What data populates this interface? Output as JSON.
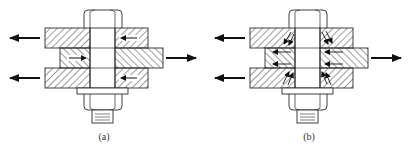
{
  "figure": {
    "colors": {
      "line": "#2a2a2a",
      "hatch": "#3a3a3a",
      "arrow": "#111111",
      "background": "#ffffff"
    },
    "panels": [
      {
        "id": "a",
        "label": "(a)",
        "offset_x": 0,
        "caption_meaning": "Load transferred by bearing/shear: single horizontal arrows inside plates",
        "internal_arrows": "horizontal"
      },
      {
        "id": "b",
        "label": "(b)",
        "offset_x": 205,
        "caption_meaning": "Load transferred by friction with clamping: diagonal and horizontal arrows inside plates",
        "internal_arrows": "diagonal"
      }
    ],
    "external_loads": {
      "left_arrows": 2,
      "right_arrows": 1
    }
  }
}
